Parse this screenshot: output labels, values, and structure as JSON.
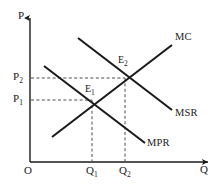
{
  "figure": {
    "type": "economics-diagram",
    "title": "",
    "background_color": "#ffffff",
    "line_color": "#1a1a1a",
    "dash_color": "#555555",
    "axes": {
      "y_axis_label": "P",
      "x_axis_label": "Q",
      "origin_label": "O",
      "y_axis_x": 30,
      "x_axis_y": 162,
      "y_axis_top": 16,
      "x_axis_right": 210
    },
    "price_ticks": [
      {
        "label": "P",
        "sub": "2",
        "value_y": 78,
        "text_x": 13,
        "text_y": 72
      },
      {
        "label": "P",
        "sub": "1",
        "value_y": 100,
        "text_x": 13,
        "text_y": 94
      }
    ],
    "quantity_ticks": [
      {
        "label": "Q",
        "sub": "1",
        "value_x": 92,
        "text_x": 86,
        "text_y": 166
      },
      {
        "label": "Q",
        "sub": "2",
        "value_x": 125,
        "text_x": 119,
        "text_y": 166
      }
    ],
    "curves": [
      {
        "name": "MC",
        "label": "MC",
        "slope": "upward",
        "x1": 52,
        "y1": 137,
        "x2": 172,
        "y2": 45,
        "label_x": 175,
        "label_y": 34
      },
      {
        "name": "MSR",
        "label": "MSR",
        "slope": "downward",
        "x1": 78,
        "y1": 38,
        "x2": 172,
        "y2": 110,
        "label_x": 175,
        "label_y": 110
      },
      {
        "name": "MPR",
        "label": "MPR",
        "slope": "downward",
        "x1": 44,
        "y1": 66,
        "x2": 145,
        "y2": 143,
        "label_x": 148,
        "label_y": 140
      }
    ],
    "equilibria": [
      {
        "name": "E1",
        "label": "E",
        "sub": "1",
        "x": 92,
        "y": 100,
        "text_x": 85,
        "text_y": 86,
        "curves": [
          "MC",
          "MPR"
        ],
        "price": "P1",
        "quantity": "Q1"
      },
      {
        "name": "E2",
        "label": "E",
        "sub": "2",
        "x": 125,
        "y": 78,
        "text_x": 118,
        "text_y": 57,
        "curves": [
          "MC",
          "MSR"
        ],
        "price": "P2",
        "quantity": "Q2"
      }
    ],
    "guide_lines": [
      {
        "name": "p2-guide",
        "x1": 30,
        "y1": 78,
        "x2": 125,
        "y2": 78,
        "orientation": "horizontal"
      },
      {
        "name": "p1-guide",
        "x1": 30,
        "y1": 100,
        "x2": 92,
        "y2": 100,
        "orientation": "horizontal"
      },
      {
        "name": "q1-guide",
        "x1": 92,
        "y1": 100,
        "x2": 92,
        "y2": 162,
        "orientation": "vertical"
      },
      {
        "name": "q2-guide",
        "x1": 125,
        "y1": 78,
        "x2": 125,
        "y2": 162,
        "orientation": "vertical"
      }
    ]
  }
}
